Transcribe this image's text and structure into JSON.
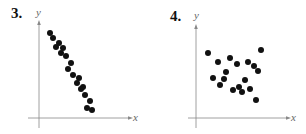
{
  "chart_data": [
    {
      "type": "scatter",
      "panel_label": "3.",
      "title": "",
      "xlabel": "x",
      "ylabel": "y",
      "grid": false,
      "ticks": "none",
      "description": "Strong negative linear correlation",
      "points_px": [
        [
          50,
          33
        ],
        [
          53,
          38
        ],
        [
          56,
          47
        ],
        [
          59,
          43
        ],
        [
          63,
          48
        ],
        [
          61,
          53
        ],
        [
          66,
          56
        ],
        [
          71,
          63
        ],
        [
          68,
          69
        ],
        [
          73,
          75
        ],
        [
          79,
          78
        ],
        [
          77,
          83
        ],
        [
          83,
          87
        ],
        [
          81,
          89
        ],
        [
          85,
          95
        ],
        [
          90,
          101
        ],
        [
          87,
          108
        ],
        [
          92,
          110
        ]
      ],
      "axes_px": {
        "origin": [
          39,
          118
        ],
        "x_end": 130,
        "y_end": 23,
        "x_start": 28,
        "y_start": 128
      }
    },
    {
      "type": "scatter",
      "panel_label": "4.",
      "title": "",
      "xlabel": "x",
      "ylabel": "y",
      "grid": false,
      "ticks": "none",
      "description": "No correlation",
      "points_px": [
        [
          208,
          53
        ],
        [
          261,
          50
        ],
        [
          218,
          62
        ],
        [
          230,
          58
        ],
        [
          237,
          64
        ],
        [
          248,
          62
        ],
        [
          254,
          66
        ],
        [
          258,
          71
        ],
        [
          226,
          72
        ],
        [
          213,
          78
        ],
        [
          224,
          79
        ],
        [
          245,
          80
        ],
        [
          220,
          85
        ],
        [
          239,
          87
        ],
        [
          250,
          89
        ],
        [
          233,
          90
        ],
        [
          242,
          92
        ],
        [
          256,
          100
        ]
      ],
      "axes_px": {
        "origin": [
          196,
          118
        ],
        "x_end": 288,
        "y_end": 27,
        "x_start": 188,
        "y_start": 128
      }
    }
  ],
  "panels": [
    {
      "label": "3.",
      "xlabel": "x",
      "ylabel": "y"
    },
    {
      "label": "4.",
      "xlabel": "x",
      "ylabel": "y"
    }
  ],
  "colors": {
    "point": "#111111",
    "axis": "#888888",
    "label": "#666666"
  }
}
